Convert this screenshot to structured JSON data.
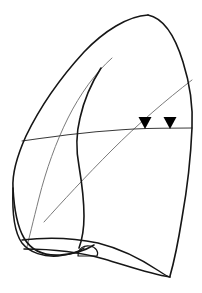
{
  "figure": {
    "view": "lateral",
    "background_color": "#ffffff",
    "line_color": "#161616",
    "faint_line_color": "#7b7b7b",
    "marker_color": "#000000",
    "width": 202,
    "height": 293
  },
  "strokes": {
    "lung_outer_border": {
      "name": "lung-outline",
      "color": "#161616",
      "width": 1.6,
      "path": "M148,15 C128,16 104,31 84,52 C62,76 40,107 26,136 C17,156 12,172 13,188 C14,208 17,226 24,238 C31,250 44,256 60,255 C74,254 86,250 94,245"
    },
    "lung_apex_right_border": {
      "name": "lung-right-border",
      "color": "#161616",
      "width": 1.6,
      "path": "M148,15 C163,18 175,36 183,62 C190,84 193,108 192,128 C191,152 187,190 182,218 C178,243 174,262 170,276"
    },
    "mediastinal_border": {
      "name": "mediastinal-border",
      "color": "#161616",
      "width": 1.6,
      "path": "M101,68 C92,82 84,100 80,118 C76,134 76,150 79,166 C82,184 84,200 84,216 C84,230 82,240 79,248"
    },
    "inner_faint_curve": {
      "name": "inner-fissure-curve",
      "color": "#7b7b7b",
      "width": 1.0,
      "path": "M112,58 C96,72 80,94 68,118 C56,142 46,170 39,198 C33,222 29,238 27,247"
    },
    "oblique_fissure": {
      "name": "oblique-fissure",
      "color": "#7b7b7b",
      "width": 1.0,
      "path": "M192,80 C166,100 138,124 112,150 C86,176 62,202 44,222"
    },
    "horizontal_fissure": {
      "name": "horizontal-fissure",
      "color": "#555555",
      "width": 1.1,
      "path": "M22,141 C56,136 96,131 134,129 C158,128 178,128 192,128"
    },
    "diaphragm_upper": {
      "name": "diaphragm-upper-contour",
      "color": "#161616",
      "width": 1.5,
      "path": "M22,240 C48,237 74,238 98,243 C122,249 144,261 159,271 C165,275 168,277 170,277"
    },
    "diaphragm_lower": {
      "name": "diaphragm-lower-contour",
      "color": "#161616",
      "width": 1.5,
      "path": "M24,249 C52,249 80,252 104,259 C128,266 150,274 170,277"
    },
    "costophrenic_left_base": {
      "name": "left-base-curve",
      "color": "#161616",
      "width": 1.5,
      "path": "M13,188 C12,212 14,232 22,243 C30,253 44,257 58,256 C70,255 78,252 84,248"
    },
    "hilum_shape": {
      "name": "hilum-marking",
      "color": "#161616",
      "width": 1.2,
      "path": "M78,256 C78,248 84,245 90,246 C96,247 99,252 97,256 Z"
    }
  },
  "markers": [
    {
      "name": "arrowhead-marker-1",
      "label": "arrowhead",
      "shape": "triangle-down",
      "color": "#000000",
      "x": 145,
      "y": 117,
      "width": 13,
      "height": 12
    },
    {
      "name": "arrowhead-marker-2",
      "label": "arrowhead",
      "shape": "triangle-down",
      "color": "#000000",
      "x": 170,
      "y": 117,
      "width": 13,
      "height": 12
    }
  ]
}
